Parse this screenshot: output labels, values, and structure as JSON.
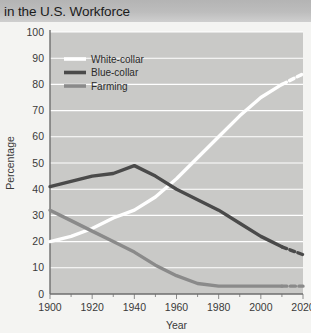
{
  "header": {
    "title": "in the U.S. Workforce"
  },
  "chart_data": {
    "type": "line",
    "title": "in the U.S. Workforce",
    "xlabel": "Year",
    "ylabel": "Percentage",
    "xlim": [
      1900,
      2020
    ],
    "ylim": [
      0,
      100
    ],
    "grid": true,
    "legend_position": "top-left-inside",
    "x_major_ticks": [
      1900,
      1920,
      1940,
      1960,
      1980,
      2000,
      2020
    ],
    "x_minor_ticks": [
      1910,
      1930,
      1950,
      1970,
      1990,
      2010
    ],
    "y_ticks": [
      0,
      10,
      20,
      30,
      40,
      50,
      60,
      70,
      80,
      90,
      100
    ],
    "x_tick_labels": [
      "1900",
      "1920",
      "1940",
      "1960",
      "1980",
      "2000",
      "2020"
    ],
    "y_tick_labels": [
      "0",
      "10",
      "20",
      "30",
      "40",
      "50",
      "60",
      "70",
      "80",
      "90",
      "100"
    ],
    "projection_starts_at": 2010,
    "projection_note": "dashed segments indicate projected values after 2010",
    "series": [
      {
        "name": "White-collar",
        "color": "#ffffff",
        "x": [
          1900,
          1910,
          1920,
          1930,
          1940,
          1950,
          1960,
          1970,
          1980,
          1990,
          2000,
          2010,
          2020
        ],
        "values": [
          20,
          22,
          25,
          29,
          32,
          37,
          44,
          52,
          60,
          68,
          75,
          80,
          84
        ],
        "solid_until": 2010
      },
      {
        "name": "Blue-collar",
        "color": "#4a4a4a",
        "x": [
          1900,
          1910,
          1920,
          1930,
          1940,
          1950,
          1960,
          1970,
          1980,
          1990,
          2000,
          2010,
          2020
        ],
        "values": [
          41,
          43,
          45,
          46,
          49,
          45,
          40,
          36,
          32,
          27,
          22,
          18,
          15
        ],
        "solid_until": 2010
      },
      {
        "name": "Farming",
        "color": "#8a8a8a",
        "x": [
          1900,
          1910,
          1920,
          1930,
          1940,
          1950,
          1960,
          1970,
          1980,
          1990,
          2000,
          2010,
          2020
        ],
        "values": [
          32,
          28,
          24,
          20,
          16,
          11,
          7,
          4,
          3,
          3,
          3,
          3,
          3
        ],
        "solid_until": 2010
      }
    ]
  },
  "legend": {
    "items": [
      {
        "label": "White-collar",
        "color": "#ffffff"
      },
      {
        "label": "Blue-collar",
        "color": "#4a4a4a"
      },
      {
        "label": "Farming",
        "color": "#8a8a8a"
      }
    ]
  },
  "axes": {
    "x_title": "Year",
    "y_title": "Percentage"
  }
}
